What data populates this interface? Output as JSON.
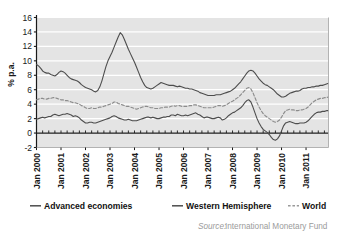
{
  "chart_data": {
    "type": "line",
    "title": "",
    "subtitle": "",
    "xlabel": "",
    "ylabel": "% p.a.",
    "ylim": [
      -2,
      16
    ],
    "ytick_labels": [
      "16",
      "14",
      "12",
      "10",
      "8",
      "6",
      "4",
      "2",
      "0",
      "-2"
    ],
    "ytick_values": [
      16,
      14,
      12,
      10,
      8,
      6,
      4,
      2,
      0,
      -2
    ],
    "xtick_labels": [
      "Jan 2000",
      "Jan 2001",
      "Jan 2002",
      "Jan 2003",
      "Jan 2004",
      "Jan 2005",
      "Jan 2006",
      "Jan 2007",
      "Jan 2008",
      "Jan 2009",
      "Jan 2010",
      "Jan 2011"
    ],
    "xtick_values": [
      0,
      12,
      24,
      36,
      48,
      60,
      72,
      84,
      96,
      108,
      120,
      132
    ],
    "x_start_label": "Jan 2000",
    "x_end_label": "Dec 2011",
    "x_range_months": [
      0,
      143
    ],
    "grid": "horizontal-white-on-gray",
    "legend_position": "below-axes",
    "series": [
      {
        "name": "Advanced economies",
        "style": "solid",
        "color": "#4d4d4d",
        "values": [
          1.9,
          2.0,
          2.1,
          2.2,
          2.1,
          2.2,
          2.3,
          2.3,
          2.5,
          2.6,
          2.5,
          2.4,
          2.5,
          2.6,
          2.6,
          2.7,
          2.6,
          2.5,
          2.3,
          2.4,
          2.3,
          2.1,
          1.8,
          1.6,
          1.4,
          1.4,
          1.5,
          1.5,
          1.4,
          1.4,
          1.5,
          1.6,
          1.7,
          1.8,
          1.9,
          2.0,
          2.1,
          2.3,
          2.4,
          2.3,
          2.1,
          2.0,
          1.9,
          1.8,
          1.8,
          1.9,
          1.8,
          1.7,
          1.7,
          1.7,
          1.8,
          1.9,
          2.0,
          2.1,
          2.2,
          2.2,
          2.1,
          2.2,
          2.1,
          2.0,
          2.0,
          2.1,
          2.2,
          2.2,
          2.3,
          2.3,
          2.5,
          2.5,
          2.4,
          2.6,
          2.5,
          2.4,
          2.4,
          2.5,
          2.4,
          2.5,
          2.6,
          2.7,
          2.8,
          2.6,
          2.5,
          2.3,
          2.1,
          2.2,
          2.2,
          2.1,
          2.0,
          2.0,
          2.1,
          2.2,
          2.1,
          1.8,
          1.9,
          2.1,
          2.4,
          2.6,
          2.8,
          2.9,
          3.1,
          3.3,
          3.5,
          3.8,
          4.2,
          4.5,
          4.6,
          4.3,
          3.6,
          2.8,
          2.0,
          1.4,
          0.9,
          0.5,
          0.3,
          0.1,
          -0.2,
          -0.6,
          -0.9,
          -1.0,
          -0.8,
          -0.4,
          0.3,
          1.0,
          1.4,
          1.5,
          1.6,
          1.5,
          1.4,
          1.3,
          1.3,
          1.4,
          1.4,
          1.4,
          1.5,
          1.7,
          2.0,
          2.3,
          2.6,
          2.8,
          2.9,
          2.9,
          3.0,
          3.0,
          3.1,
          3.1
        ]
      },
      {
        "name": "Western Hemisphere",
        "style": "solid",
        "color": "#4d4d4d",
        "values": [
          9.5,
          9.3,
          9.0,
          8.6,
          8.4,
          8.3,
          8.3,
          8.1,
          8.0,
          7.9,
          8.1,
          8.4,
          8.6,
          8.5,
          8.3,
          8.0,
          7.7,
          7.5,
          7.4,
          7.3,
          7.2,
          7.0,
          6.7,
          6.5,
          6.3,
          6.2,
          6.1,
          6.0,
          5.8,
          5.7,
          5.9,
          6.4,
          7.2,
          8.2,
          9.2,
          10.0,
          10.6,
          11.2,
          11.9,
          12.6,
          13.3,
          13.9,
          13.6,
          13.0,
          12.3,
          11.6,
          11.0,
          10.4,
          9.8,
          9.1,
          8.4,
          7.7,
          7.1,
          6.6,
          6.3,
          6.2,
          6.1,
          6.2,
          6.4,
          6.6,
          6.8,
          7.0,
          6.9,
          6.8,
          6.7,
          6.6,
          6.6,
          6.6,
          6.5,
          6.4,
          6.5,
          6.4,
          6.3,
          6.2,
          6.2,
          6.1,
          6.1,
          6.0,
          5.9,
          5.8,
          5.6,
          5.5,
          5.4,
          5.3,
          5.2,
          5.2,
          5.2,
          5.2,
          5.3,
          5.3,
          5.3,
          5.4,
          5.5,
          5.6,
          5.7,
          5.8,
          6.0,
          6.2,
          6.5,
          6.8,
          7.1,
          7.5,
          7.9,
          8.3,
          8.6,
          8.7,
          8.6,
          8.3,
          7.9,
          7.5,
          7.2,
          6.9,
          6.7,
          6.6,
          6.4,
          6.2,
          6.0,
          5.7,
          5.4,
          5.2,
          5.0,
          5.0,
          5.1,
          5.3,
          5.5,
          5.6,
          5.7,
          5.8,
          5.8,
          5.9,
          6.1,
          6.2,
          6.2,
          6.3,
          6.3,
          6.4,
          6.4,
          6.5,
          6.5,
          6.6,
          6.6,
          6.7,
          6.8,
          6.9
        ]
      },
      {
        "name": "World",
        "style": "dashed",
        "color": "#8c8c8c",
        "values": [
          4.6,
          4.7,
          4.8,
          4.8,
          4.7,
          4.7,
          4.8,
          4.8,
          4.9,
          4.9,
          4.8,
          4.7,
          4.6,
          4.6,
          4.5,
          4.5,
          4.4,
          4.3,
          4.2,
          4.2,
          4.1,
          4.0,
          3.8,
          3.7,
          3.5,
          3.4,
          3.4,
          3.5,
          3.4,
          3.4,
          3.5,
          3.6,
          3.6,
          3.7,
          3.8,
          3.9,
          4.0,
          4.1,
          4.3,
          4.3,
          4.1,
          4.0,
          3.9,
          3.8,
          3.7,
          3.7,
          3.6,
          3.5,
          3.4,
          3.3,
          3.4,
          3.5,
          3.6,
          3.7,
          3.7,
          3.6,
          3.5,
          3.5,
          3.4,
          3.4,
          3.4,
          3.5,
          3.5,
          3.6,
          3.6,
          3.6,
          3.7,
          3.8,
          3.7,
          3.8,
          3.8,
          3.7,
          3.7,
          3.7,
          3.7,
          3.8,
          3.8,
          3.9,
          3.9,
          3.8,
          3.7,
          3.6,
          3.5,
          3.5,
          3.5,
          3.5,
          3.5,
          3.6,
          3.7,
          3.8,
          3.8,
          3.7,
          3.8,
          3.9,
          4.1,
          4.3,
          4.4,
          4.6,
          4.8,
          5.0,
          5.3,
          5.6,
          5.9,
          6.2,
          6.3,
          6.1,
          5.6,
          4.9,
          4.2,
          3.6,
          3.1,
          2.7,
          2.4,
          2.2,
          2.0,
          1.8,
          1.6,
          1.5,
          1.6,
          1.8,
          2.2,
          2.7,
          3.1,
          3.2,
          3.3,
          3.2,
          3.2,
          3.1,
          3.1,
          3.2,
          3.2,
          3.3,
          3.4,
          3.6,
          3.9,
          4.2,
          4.4,
          4.6,
          4.7,
          4.8,
          4.8,
          4.9,
          4.9,
          5.0
        ]
      }
    ]
  },
  "legend": {
    "items": [
      {
        "label": "Advanced economies",
        "marker": "solid-line",
        "color": "#4d4d4d"
      },
      {
        "label": "Western Hemisphere",
        "marker": "solid-line",
        "color": "#4d4d4d"
      },
      {
        "label": "World",
        "marker": "dashed-line",
        "color": "#9a9a9a"
      }
    ]
  },
  "source": {
    "prefix": "Source:",
    "text": "International Monetary Fund"
  },
  "colors": {
    "plot_background": "#e4e4e4",
    "gridline": "#ffffff",
    "axis": "#1a1a1a",
    "series_dark": "#4d4d4d",
    "series_gray": "#8c8c8c",
    "source_gray": "#9b9b9b"
  }
}
